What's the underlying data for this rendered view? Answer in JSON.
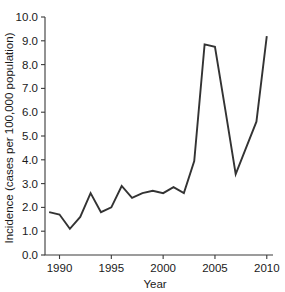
{
  "chart_data": {
    "type": "line",
    "title": "",
    "xlabel": "Year",
    "ylabel": "Incidence (cases per 100,000 population)",
    "xlim": [
      1988.6,
      2010.6
    ],
    "ylim": [
      0.0,
      10.0
    ],
    "grid": false,
    "legend": null,
    "line_color": "#333333",
    "x": [
      1989,
      1990,
      1991,
      1992,
      1993,
      1994,
      1995,
      1996,
      1997,
      1998,
      1999,
      2000,
      2001,
      2002,
      2003,
      2004,
      2005,
      2006,
      2007,
      2008,
      2009,
      2010
    ],
    "values": [
      1.8,
      1.7,
      1.1,
      1.6,
      2.6,
      1.8,
      2.0,
      2.9,
      2.4,
      2.6,
      2.7,
      2.6,
      2.85,
      2.6,
      3.95,
      8.85,
      8.75,
      6.1,
      3.4,
      4.5,
      5.6,
      9.2
    ],
    "series": [
      {
        "name": "Incidence",
        "values": [
          1.8,
          1.7,
          1.1,
          1.6,
          2.6,
          1.8,
          2.0,
          2.9,
          2.4,
          2.6,
          2.7,
          2.6,
          2.85,
          2.6,
          3.95,
          8.85,
          8.75,
          6.1,
          3.4,
          4.5,
          5.6,
          9.2
        ]
      }
    ],
    "x_tick_values": [
      1990,
      1995,
      2000,
      2005,
      2010
    ],
    "x_tick_labels": [
      "1990",
      "1995",
      "2000",
      "2005",
      "2010"
    ],
    "y_tick_values": [
      0.0,
      1.0,
      2.0,
      3.0,
      4.0,
      5.0,
      6.0,
      7.0,
      8.0,
      9.0,
      10.0
    ],
    "y_tick_labels": [
      "0.0",
      "1.0",
      "2.0",
      "3.0",
      "4.0",
      "5.0",
      "6.0",
      "7.0",
      "8.0",
      "9.0",
      "10.0"
    ]
  }
}
